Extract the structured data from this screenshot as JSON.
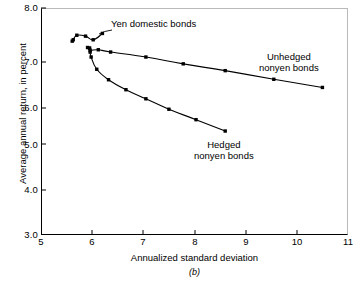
{
  "chart_data": {
    "type": "scatter",
    "title": "",
    "caption": "(b)",
    "xlabel": "Annualized standard deviation",
    "ylabel": "Average annual return, in percent",
    "xlim": [
      5,
      11
    ],
    "ylim": [
      3.0,
      8.0
    ],
    "xticks": [
      "5",
      "6",
      "7",
      "8",
      "9",
      "10",
      "11"
    ],
    "yticks": [
      "8.0",
      "7.0",
      "6.0",
      "5.0",
      "4.0",
      "3.0"
    ],
    "grid": false,
    "legend": "annotations-inline",
    "marker": "filled-square",
    "line_color": "#000000",
    "series": [
      {
        "name": "Yen domestic bonds",
        "label": "Yen domestic bonds",
        "points": [
          [
            5.61,
            7.27
          ],
          [
            5.63,
            7.3
          ],
          [
            5.7,
            7.4
          ],
          [
            5.87,
            7.38
          ],
          [
            6.02,
            7.3
          ],
          [
            6.2,
            7.44
          ]
        ]
      },
      {
        "name": "Unhedged nonyen bonds",
        "label_line1": "Unhedged",
        "label_line2": "nonyen bonds",
        "points": [
          [
            5.91,
            7.13
          ],
          [
            5.96,
            7.07
          ],
          [
            6.12,
            7.08
          ],
          [
            6.36,
            7.03
          ],
          [
            7.05,
            6.92
          ],
          [
            7.78,
            6.77
          ],
          [
            8.6,
            6.62
          ],
          [
            9.55,
            6.43
          ],
          [
            10.5,
            6.25
          ]
        ]
      },
      {
        "name": "Hedged nonyen bonds",
        "label_line1": "Hedged",
        "label_line2": "nonyen bonds",
        "points": [
          [
            5.95,
            7.12
          ],
          [
            5.96,
            7.03
          ],
          [
            5.98,
            6.92
          ],
          [
            6.09,
            6.65
          ],
          [
            6.32,
            6.42
          ],
          [
            6.66,
            6.2
          ],
          [
            7.05,
            6.0
          ],
          [
            7.5,
            5.77
          ],
          [
            8.03,
            5.54
          ],
          [
            8.6,
            5.29
          ]
        ]
      }
    ]
  }
}
